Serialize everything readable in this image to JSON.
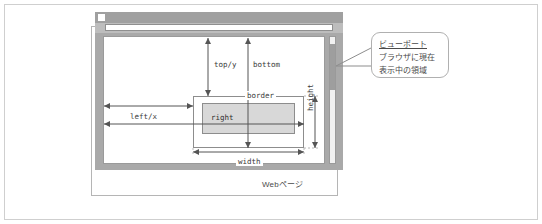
{
  "figure": {
    "webpage_label": "Webページ"
  },
  "browser": {
    "icon_name": "window-icon",
    "addressbar_value": ""
  },
  "element_boxes": {
    "border_label": "border",
    "content_label": "right"
  },
  "dimensions": {
    "top_y": "top/y",
    "bottom": "bottom",
    "left_x": "left/x",
    "width": "width",
    "height": "height"
  },
  "callout": {
    "title": "ビューポート",
    "line1": "ブラウザに現在",
    "line2": "表示中の領域"
  },
  "colors": {
    "frame_border": "#cfcfcf",
    "window_chrome": "#a9a9a9",
    "titlebar": "#a0a0a0",
    "addressbar_strip": "#bdbdbd",
    "content_fill": "#d8d8d8",
    "scrollbar_thumb": "#9e9e9e",
    "line": "#555555",
    "text": "#3a3a3a"
  }
}
